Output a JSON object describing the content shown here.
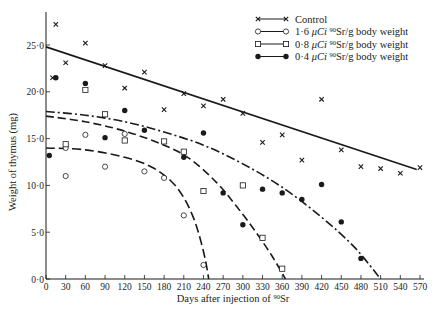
{
  "chart_data": {
    "type": "scatter",
    "title": "",
    "xlabel": "Days after injection of 90Sr",
    "xlabel_parts": {
      "prefix": "Days after injection of ",
      "superscript": "90",
      "suffix": "Sr"
    },
    "ylabel": "Weight of thymus (mg)",
    "xlim": [
      0,
      570
    ],
    "ylim": [
      0,
      27.5
    ],
    "x_ticks": [
      0,
      30,
      60,
      90,
      120,
      150,
      180,
      210,
      240,
      270,
      300,
      330,
      360,
      390,
      420,
      450,
      480,
      510,
      540,
      570
    ],
    "y_ticks": [
      0,
      5,
      10,
      15,
      20,
      25
    ],
    "y_tick_labels": [
      "0·0",
      "5·0",
      "10·0",
      "15·0",
      "20·0",
      "25·0"
    ],
    "grid": false,
    "legend_position": "upper right",
    "series": [
      {
        "name": "Control",
        "marker": "x",
        "line_style": "solid",
        "fit_line": [
          [
            0,
            24.8
          ],
          [
            565,
            11.7
          ]
        ],
        "points": [
          [
            10,
            21.5
          ],
          [
            15,
            27.2
          ],
          [
            30,
            23.1
          ],
          [
            60,
            25.2
          ],
          [
            90,
            22.8
          ],
          [
            120,
            20.4
          ],
          [
            150,
            22.1
          ],
          [
            180,
            18.1
          ],
          [
            210,
            19.8
          ],
          [
            240,
            18.5
          ],
          [
            270,
            19.2
          ],
          [
            300,
            17.7
          ],
          [
            330,
            14.6
          ],
          [
            360,
            15.4
          ],
          [
            390,
            12.7
          ],
          [
            420,
            19.2
          ],
          [
            450,
            13.8
          ],
          [
            480,
            12.0
          ],
          [
            510,
            11.8
          ],
          [
            540,
            11.3
          ],
          [
            570,
            11.9
          ]
        ]
      },
      {
        "name": "1·6 μCi 90Sr/g body weight",
        "legend_parts": {
          "dose": "1·6 ",
          "unit": "μCi ",
          "sup": "90",
          "rest": "Sr/g body weight"
        },
        "marker": "open-circle",
        "line_style": "long-dash",
        "fit_curve": [
          [
            0,
            14.0
          ],
          [
            60,
            13.8
          ],
          [
            120,
            13.0
          ],
          [
            160,
            12.0
          ],
          [
            190,
            10.5
          ],
          [
            210,
            8.7
          ],
          [
            225,
            6.5
          ],
          [
            235,
            4.3
          ],
          [
            243,
            2.0
          ],
          [
            248,
            0.0
          ]
        ],
        "points": [
          [
            30,
            11.0
          ],
          [
            30,
            14.0
          ],
          [
            60,
            15.4
          ],
          [
            90,
            12.0
          ],
          [
            120,
            15.5
          ],
          [
            150,
            11.5
          ],
          [
            180,
            10.8
          ],
          [
            210,
            6.8
          ],
          [
            240,
            1.5
          ]
        ]
      },
      {
        "name": "0·8 μCi 90Sr/g body weight",
        "legend_parts": {
          "dose": "0·8 ",
          "unit": "μCi ",
          "sup": "90",
          "rest": "Sr/g body weight"
        },
        "marker": "open-square",
        "line_style": "dash",
        "fit_curve": [
          [
            0,
            17.4
          ],
          [
            60,
            16.8
          ],
          [
            120,
            15.8
          ],
          [
            180,
            14.3
          ],
          [
            220,
            12.8
          ],
          [
            260,
            10.3
          ],
          [
            290,
            7.8
          ],
          [
            320,
            5.0
          ],
          [
            345,
            2.4
          ],
          [
            365,
            0.0
          ]
        ],
        "points": [
          [
            30,
            14.4
          ],
          [
            60,
            20.2
          ],
          [
            90,
            17.6
          ],
          [
            120,
            14.8
          ],
          [
            180,
            14.7
          ],
          [
            210,
            13.6
          ],
          [
            240,
            9.4
          ],
          [
            300,
            10.0
          ],
          [
            330,
            4.4
          ],
          [
            360,
            1.1
          ]
        ]
      },
      {
        "name": "0·4 μCi 90Sr/g body weight",
        "legend_parts": {
          "dose": "0·4 ",
          "unit": "μCi ",
          "sup": "90",
          "rest": "Sr/g body weight"
        },
        "marker": "filled-circle",
        "line_style": "dash-dot",
        "fit_curve": [
          [
            0,
            17.9
          ],
          [
            60,
            17.5
          ],
          [
            120,
            16.8
          ],
          [
            180,
            15.7
          ],
          [
            240,
            14.3
          ],
          [
            300,
            12.3
          ],
          [
            360,
            9.8
          ],
          [
            420,
            6.6
          ],
          [
            470,
            3.4
          ],
          [
            510,
            0.0
          ]
        ],
        "points": [
          [
            5,
            13.2
          ],
          [
            15,
            21.5
          ],
          [
            60,
            20.9
          ],
          [
            90,
            15.1
          ],
          [
            120,
            18.0
          ],
          [
            150,
            15.9
          ],
          [
            210,
            13.0
          ],
          [
            240,
            15.6
          ],
          [
            270,
            9.2
          ],
          [
            300,
            5.8
          ],
          [
            330,
            9.6
          ],
          [
            360,
            9.2
          ],
          [
            390,
            8.5
          ],
          [
            420,
            10.1
          ],
          [
            450,
            6.1
          ],
          [
            480,
            2.2
          ]
        ]
      }
    ]
  },
  "colors": {
    "ink": "#1a1a1a",
    "background": "#ffffff"
  }
}
